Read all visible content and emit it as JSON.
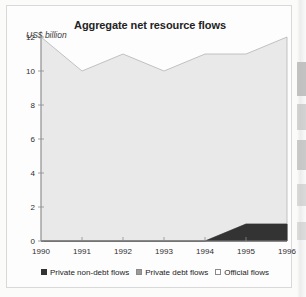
{
  "chart_data": {
    "type": "area",
    "title": "Aggregate net resource flows",
    "subtitle": "",
    "xlabel": "",
    "ylabel": "US$ billion",
    "unit_label": "US$ billion",
    "stacked": true,
    "grid": false,
    "legend_position": "bottom",
    "categories": [
      "1990",
      "1991",
      "1992",
      "1993",
      "1994",
      "1995",
      "1996"
    ],
    "x": [
      1990,
      1991,
      1992,
      1993,
      1994,
      1995,
      1996
    ],
    "xlim": [
      1990,
      1996
    ],
    "ylim": [
      0,
      12
    ],
    "yticks": [
      0,
      2,
      4,
      6,
      8,
      10,
      12
    ],
    "ytick_labels": [
      "0",
      "2",
      "4",
      "6",
      "8",
      "10",
      "12"
    ],
    "xtick_labels": [
      "1990",
      "1991",
      "1992",
      "1993",
      "1994",
      "1995",
      "1996"
    ],
    "series": [
      {
        "name": "Private non-debt flows",
        "color": "#333333",
        "values": [
          0,
          0,
          0,
          0,
          0,
          1.0,
          1.0
        ]
      },
      {
        "name": "Private debt flows",
        "color": "#9a9a9a",
        "values": [
          0,
          0,
          0,
          0,
          0,
          0,
          0
        ]
      },
      {
        "name": "Official flows",
        "color": "#e9e9e9",
        "values": [
          12.0,
          10.0,
          11.0,
          10.0,
          11.0,
          10.0,
          11.0
        ]
      }
    ],
    "cumulative_top": [
      12.0,
      10.0,
      11.0,
      10.0,
      11.0,
      10.0,
      11.0
    ],
    "annotations": []
  },
  "legend": {
    "items": [
      {
        "label": "Private non-debt flows",
        "swatch": "#333333",
        "border": "#333333"
      },
      {
        "label": "Private debt flows",
        "swatch": "#9a9a9a",
        "border": "#8a8a8a"
      },
      {
        "label": "Official flows",
        "swatch": "#ffffff",
        "border": "#8a8a8a"
      }
    ]
  },
  "style": {
    "plot_fill": "#e9e9e9",
    "plot_line": "#b4b4b4",
    "dark_fill": "#333333",
    "axis_color": "#8d8d8d",
    "text_color": "#232323",
    "frame_color": "#d9d9d9",
    "page_background": "#fbfbfa"
  }
}
